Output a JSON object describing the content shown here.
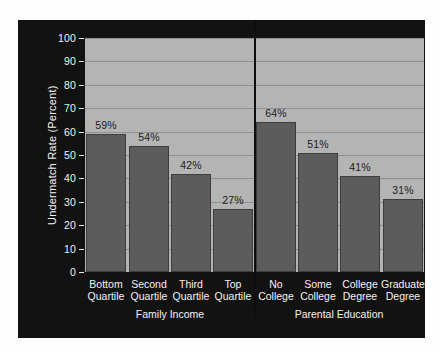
{
  "chart_data": {
    "type": "bar",
    "title": "",
    "xlabel": "",
    "ylabel": "Undermatch Rate (Percent)",
    "ylim": [
      0,
      100
    ],
    "ytick_labels": [
      "0",
      "10",
      "20",
      "30",
      "40",
      "50",
      "60",
      "70",
      "80",
      "90",
      "100"
    ],
    "ytick_values": [
      0,
      10,
      20,
      30,
      40,
      50,
      60,
      70,
      80,
      90,
      100
    ],
    "grid": true,
    "legend": "none",
    "value_suffix": "%",
    "groups": [
      {
        "name": "Family Income",
        "categories": [
          "Bottom Quartile",
          "Second Quartile",
          "Third Quartile",
          "Top Quartile"
        ],
        "category_lines": [
          [
            "Bottom",
            "Quartile"
          ],
          [
            "Second",
            "Quartile"
          ],
          [
            "Third",
            "Quartile"
          ],
          [
            "Top",
            "Quartile"
          ]
        ],
        "values": [
          59,
          54,
          42,
          27
        ],
        "value_labels": [
          "59%",
          "54%",
          "42%",
          "27%"
        ]
      },
      {
        "name": "Parental Education",
        "categories": [
          "No College",
          "Some College",
          "College Degree",
          "Graduate Degree"
        ],
        "category_lines": [
          [
            "No",
            "College"
          ],
          [
            "Some",
            "College"
          ],
          [
            "College",
            "Degree"
          ],
          [
            "Graduate",
            "Degree"
          ]
        ],
        "values": [
          64,
          51,
          41,
          31
        ],
        "value_labels": [
          "64%",
          "51%",
          "41%",
          "31%"
        ]
      }
    ],
    "colors": {
      "panel_background": "#121212",
      "plot_background": "#b4b4b4",
      "bar_fill": "#5c5c5c",
      "bar_edge": "#3d3d3d",
      "gridline": "#8e8e8e",
      "axis_text": "#f2f2f2",
      "value_text": "#1c1c1c",
      "divider": "#0d0d0d"
    }
  }
}
